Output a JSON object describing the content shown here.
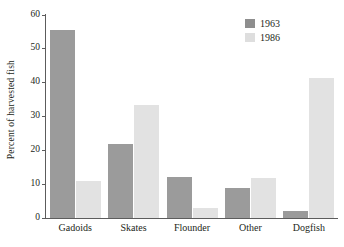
{
  "chart_data": {
    "type": "bar",
    "title": "",
    "xlabel": "",
    "ylabel": "Percent of harvested fish",
    "categories": [
      "Gadoids",
      "Skates",
      "Flounder",
      "Other",
      "Dogfish"
    ],
    "series": [
      {
        "name": "1963",
        "color": "#9b9b9b",
        "values": [
          55.5,
          22,
          12,
          9,
          2
        ]
      },
      {
        "name": "1986",
        "color": "#e2e2e2",
        "values": [
          11,
          33.5,
          3,
          11.8,
          41.5
        ]
      }
    ],
    "ylim": [
      0,
      60
    ],
    "yticks": [
      0,
      10,
      20,
      30,
      40,
      50,
      60
    ],
    "ytick_labels": [
      "0",
      "10",
      "20",
      "30",
      "40",
      "50",
      "60"
    ],
    "grid": false,
    "legend_position": "top-right",
    "legend_entries": [
      "1963",
      "1986"
    ]
  }
}
